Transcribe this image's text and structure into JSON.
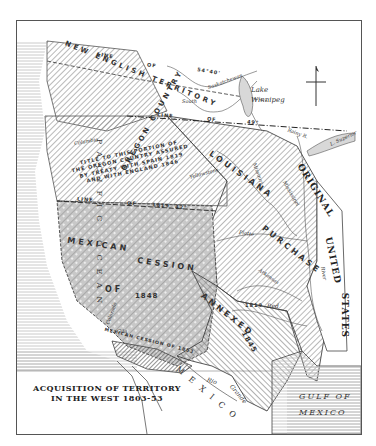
{
  "map": {
    "title_line1": "ACQUISITION OF TERRITORY",
    "title_line2": "IN THE WEST 1803-53",
    "compass": "north-arrow",
    "colors": {
      "background": "#ffffff",
      "ocean_fill": "#dcdcdc",
      "territory_hatch": "#8a8a8a",
      "border": "#444444",
      "gadsden_fill": "#9a9a9a"
    },
    "regions": {
      "new_english_territory": "NEW ENGLISH TERRITORY",
      "oregon_country": "OREGON COUNTRY",
      "oregon_title_note": [
        "TITLE TO THIS PORTION OF",
        "THE OREGON COUNTRY ASSURED",
        "BY TREATY WITH SPAIN 1819",
        "AND WITH ENGLAND 1846"
      ],
      "louisiana": "LOUISIANA",
      "purchase": "PURCHASE",
      "year_1803": "1803",
      "mexican": "MEXICAN",
      "cession": "CESSION",
      "of": "OF",
      "year_1848": "1848",
      "gadsden": "MEXICAN CESSION OF 1853",
      "annexed": "ANNEXED",
      "year_1845": "1845",
      "original": "ORIGINAL",
      "united": "UNITED",
      "states": "STATES",
      "pacific": "PACIFIC OCEAN",
      "mexico": "MEXICO",
      "gulf_line1": "GULF OF",
      "gulf_line2": "MEXICO"
    },
    "lines": {
      "line_54_40_a": "LINE",
      "line_54_40_b": "OF",
      "line_54_40_c": "54°40'",
      "line_49_a": "LINE",
      "line_49_b": "OF",
      "line_49_c": "49°",
      "line_42_a": "LINE",
      "line_42_b": "OF",
      "line_42_c": "1819",
      "line_42_d": "42°",
      "line_1819_red": "1819"
    },
    "features": {
      "lake_winnipeg_1": "Lake",
      "lake_winnipeg_2": "Winnipeg",
      "south_sask": "South",
      "north_sask": "North",
      "saskatchewan": "Saskatchewan",
      "rainy_river": "Rainy R.",
      "lake_superior": "L. Superior",
      "columbia": "Columbia",
      "snake": "Snake",
      "yellowstone": "Yellowstone",
      "missouri": "Missouri",
      "mississippi": "Mississippi",
      "platte": "Platte",
      "platte_r": "R.",
      "arkansas": "Arkansas",
      "red": "Red",
      "river": "River",
      "colorado": "Colorado",
      "gila": "Gila",
      "gila_r": "R.",
      "rio": "Rio",
      "grande": "Grande",
      "sabine": "Sabine",
      "nueces": "Nueces"
    }
  }
}
